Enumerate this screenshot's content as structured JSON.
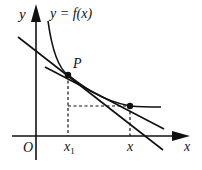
{
  "diagram": {
    "type": "function-graph-with-tangent-and-secant",
    "labels": {
      "y_axis": "y",
      "x_axis": "x",
      "origin": "O",
      "curve": "y = f(x)",
      "point": "P",
      "x1": "x",
      "x1_sub": "1",
      "x_tick": "x"
    },
    "colors": {
      "stroke": "#111111",
      "background": "#ffffff"
    },
    "elements": [
      "x-axis with arrow",
      "y-axis with arrow",
      "decreasing convex curve y=f(x)",
      "tangent line at P",
      "secant line through P and (x, f(x))",
      "dashed vertical from P to x1",
      "dashed vertical from second point to x",
      "dashed horizontal from x1 to second point"
    ]
  }
}
